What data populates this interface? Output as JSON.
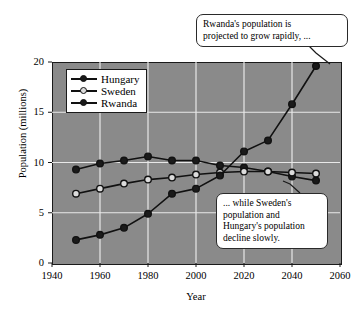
{
  "chart_data": {
    "type": "line",
    "title": "",
    "xlabel": "Year",
    "ylabel": "Population (millions)",
    "xlim": [
      1940,
      2060
    ],
    "ylim": [
      0,
      20
    ],
    "xticks": [
      1940,
      1960,
      1980,
      2000,
      2020,
      2040,
      2060
    ],
    "yticks": [
      0,
      5,
      10,
      15,
      20
    ],
    "grid": true,
    "legend_position": "upper-left-inside",
    "x": [
      1950,
      1960,
      1970,
      1980,
      1990,
      2000,
      2010,
      2020,
      2030,
      2040,
      2050
    ],
    "series": [
      {
        "name": "Hungary",
        "marker": "filled-circle",
        "values": [
          9.3,
          9.9,
          10.2,
          10.6,
          10.2,
          10.2,
          9.7,
          9.5,
          9.1,
          8.6,
          8.2
        ]
      },
      {
        "name": "Sweden",
        "marker": "open-circle",
        "values": [
          6.9,
          7.4,
          7.9,
          8.3,
          8.5,
          8.8,
          9.0,
          9.1,
          9.1,
          9.0,
          8.9
        ]
      },
      {
        "name": "Rwanda",
        "marker": "filled-circle",
        "values": [
          2.3,
          2.8,
          3.5,
          4.9,
          6.9,
          7.4,
          8.7,
          11.1,
          12.2,
          15.8,
          19.6
        ]
      }
    ],
    "annotations": [
      {
        "id": "rwanda-growth",
        "text": "Rwanda's population is projected to grow rapidly, ...",
        "lines": [
          "Rwanda's population is",
          "projected to grow rapidly, ..."
        ],
        "points_to": {
          "series": "Rwanda",
          "x": 2050,
          "y": 19.6
        }
      },
      {
        "id": "decline-note",
        "text": "... while Sweden's population and Hungary's population decline slowly.",
        "lines": [
          "... while Sweden's",
          "population and",
          "Hungary's population",
          "decline slowly."
        ],
        "points_to": {
          "series": "Sweden",
          "x": 2050,
          "y": 8.9
        }
      }
    ],
    "colors": {
      "plot_background": "#8a8a8a",
      "gridline": "#e8e8e8",
      "line": "#111111",
      "marker_fill_dark": "#1a1a1a",
      "marker_fill_light": "#dcdcdc",
      "axis": "#1a1a1a",
      "callout_background": "#ffffff",
      "figure_background": "#ffffff"
    }
  },
  "axes": {
    "y_title": "Population (millions)",
    "x_title": "Year",
    "y_tick_labels": [
      "20",
      "15",
      "10",
      "5",
      "0"
    ],
    "x_tick_labels": [
      "1940",
      "1960",
      "1980",
      "2000",
      "2020",
      "2040",
      "2060"
    ]
  },
  "legend": {
    "items": [
      {
        "label": "Hungary"
      },
      {
        "label": "Sweden"
      },
      {
        "label": "Rwanda"
      }
    ]
  },
  "callouts": {
    "rwanda": {
      "line1": "Rwanda's population is",
      "line2": "projected to grow rapidly, ..."
    },
    "decline": {
      "line1": "... while Sweden's",
      "line2": "population and",
      "line3": "Hungary's population",
      "line4": "decline slowly."
    }
  }
}
